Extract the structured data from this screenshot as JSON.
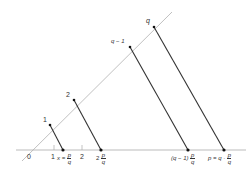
{
  "diagram": {
    "title": "",
    "colors": {
      "axis": "#aaaaaa",
      "ray": "#b0b0b0",
      "parallel": "#333333",
      "point": "#111111",
      "text": "#333333"
    },
    "ray_labels": {
      "one": "1",
      "two": "2",
      "q_minus_1": "q − 1",
      "q": "q"
    },
    "axis_labels": {
      "zero": "0",
      "one": "1",
      "two": "2",
      "x_prefix": "x =",
      "two_prefix": "2",
      "q_minus_1_prefix": "(q − 1)",
      "p_prefix": "p = q ·",
      "frac_num": "p",
      "frac_den": "q"
    }
  }
}
